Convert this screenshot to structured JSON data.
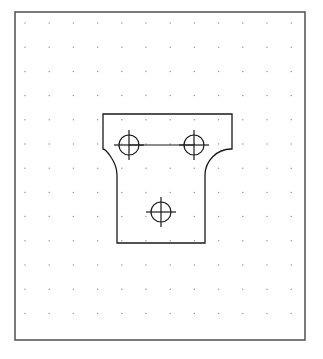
{
  "document": {
    "title": "Orthographic Sketch - T-Bracket Plate",
    "view_type": "front-view",
    "background_color": "#ffffff"
  },
  "canvas": {
    "width": 323,
    "height": 359
  },
  "border": {
    "name": "drawing-frame",
    "x": 15,
    "y": 12,
    "width": 290,
    "height": 328,
    "stroke_color": "#5a5a5a",
    "stroke_width": 1.6,
    "fill": "none"
  },
  "grid": {
    "name": "dot-grid",
    "origin_x": 25,
    "origin_y": 23,
    "spacing": 24.2,
    "columns": 12,
    "rows": 14,
    "dot_radius": 0.75,
    "dot_color": "#9a9a9a"
  },
  "part": {
    "name": "t-bracket-outline",
    "stroke_color": "#1a1a1a",
    "stroke_width": 1.3,
    "fill": "none",
    "flange": {
      "left": 103,
      "right": 232,
      "top": 114,
      "bottom": 163
    },
    "stem": {
      "left": 117,
      "right": 205,
      "top": 163,
      "bottom": 243
    },
    "fillet_radius": 14,
    "path": "M 103 114 L 232 114 L 232 149 L 231 149 C 217 149 205 161 205 175 L 205 243 L 117 243 L 117 175 C 117 161 105 149 103 149 Z"
  },
  "holes": [
    {
      "name": "hole-upper-left",
      "cx": 129,
      "cy": 145,
      "radius": 10,
      "crosshair_extent": 15,
      "stroke_color": "#1a1a1a",
      "stroke_width": 1.2
    },
    {
      "name": "hole-upper-right",
      "cx": 194,
      "cy": 145,
      "radius": 10,
      "crosshair_extent": 15,
      "stroke_color": "#1a1a1a",
      "stroke_width": 1.2
    },
    {
      "name": "hole-lower-center",
      "cx": 161,
      "cy": 212,
      "radius": 10,
      "crosshair_extent": 15,
      "stroke_color": "#1a1a1a",
      "stroke_width": 1.2
    }
  ],
  "centerlines": [
    {
      "name": "centerline-upper-holes",
      "x1": 129,
      "y1": 145,
      "x2": 194,
      "y2": 145,
      "stroke_color": "#1a1a1a",
      "stroke_width": 1.1
    }
  ],
  "colors": {
    "ink": "#1a1a1a",
    "frame": "#5a5a5a",
    "grid_dot": "#9a9a9a",
    "paper": "#ffffff"
  }
}
